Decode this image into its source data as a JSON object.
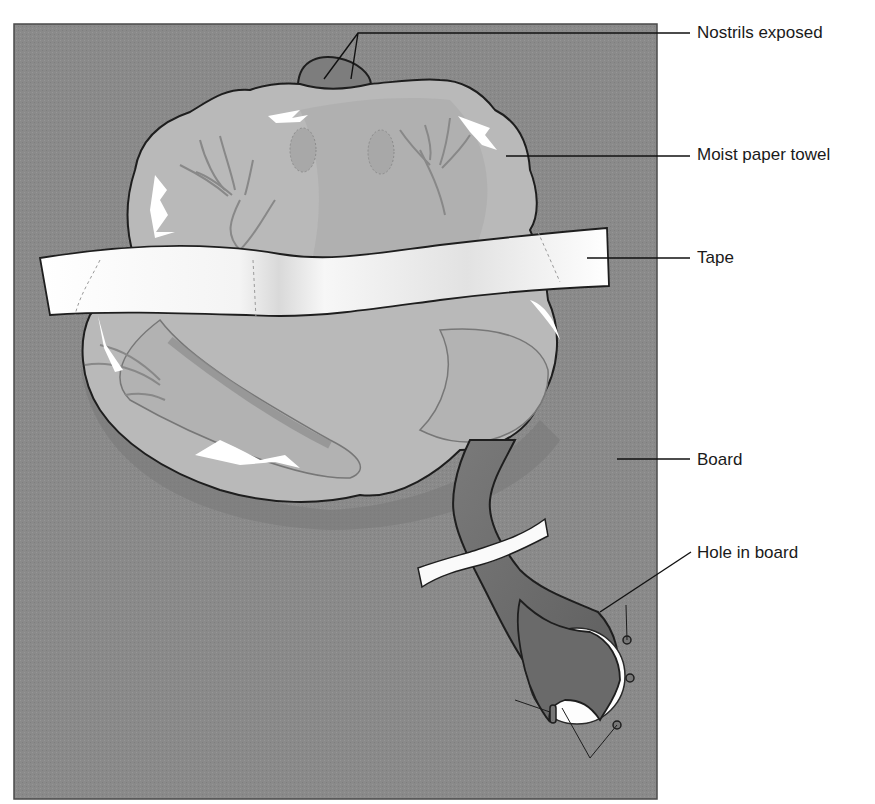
{
  "figure": {
    "colors": {
      "board": "#8a8a8a",
      "board_edge": "#4a4a4a",
      "frog_body": "#b9b9b9",
      "frog_shadow": "#9c9c9c",
      "frog_outline": "#1e1e1e",
      "nostril_area": "#7d7d7d",
      "leg": "#6d6d6d",
      "tape": "#fafafa",
      "hole": "#fdfdfd",
      "highlight": "#ffffff",
      "leader_line": "#111111",
      "text": "#1a1a1a"
    }
  },
  "labels": [
    {
      "id": "nostrils",
      "text": "Nostrils exposed",
      "x": 697,
      "y": 23
    },
    {
      "id": "towel",
      "text": "Moist paper towel",
      "x": 697,
      "y": 145
    },
    {
      "id": "tape",
      "text": "Tape",
      "x": 697,
      "y": 248
    },
    {
      "id": "board",
      "text": "Board",
      "x": 697,
      "y": 450
    },
    {
      "id": "hole",
      "text": "Hole in board",
      "x": 697,
      "y": 543
    }
  ]
}
